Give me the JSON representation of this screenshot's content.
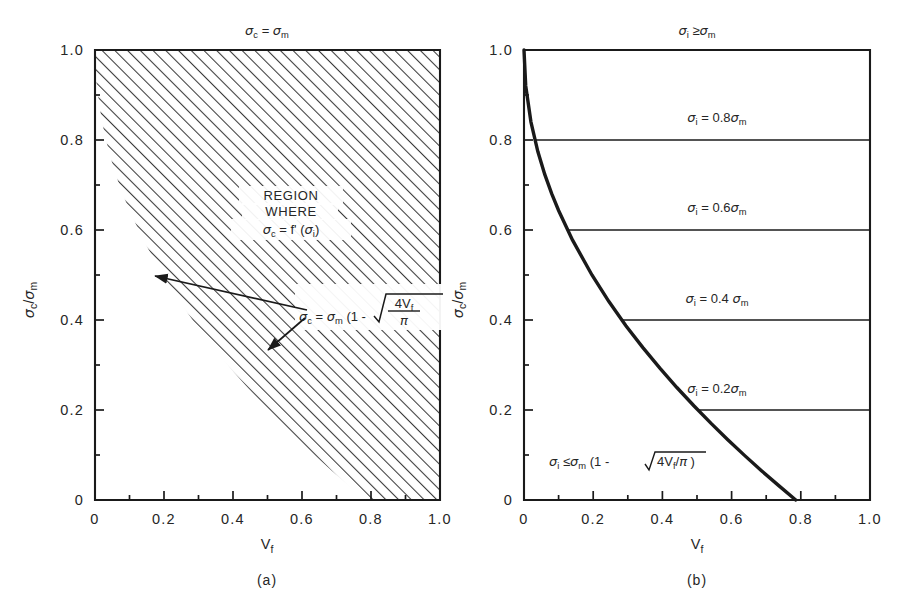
{
  "figure": {
    "background": "#ffffff",
    "ink": "#1a1a1a"
  },
  "panels": [
    {
      "id": "a",
      "label": "(a)",
      "top_label": "σc = σm",
      "xlabel": "Vf",
      "ylabel": "σc/σm",
      "annotations": {
        "region_line1": "REGION",
        "region_line2": "WHERE",
        "region_line3": "σc = f' (σi)",
        "equation": "σc = σm (1 - √(4Vf/π))"
      }
    },
    {
      "id": "b",
      "label": "(b)",
      "top_label": "σi ≥ σm",
      "xlabel": "Vf",
      "ylabel": "σc/σm",
      "annotations": {
        "line_08": "σi = 0.8σm",
        "line_06": "σi = 0.6σm",
        "line_04": "σi = 0.4σm",
        "line_02": "σi = 0.2σm",
        "lower_bound": "σi ≤ σm (1 - √4Vf/π )"
      }
    }
  ],
  "chart_data": {
    "type": "line",
    "title": "",
    "xlabel": "Vf",
    "ylabel": "σc/σm",
    "xlim": [
      0,
      1.0
    ],
    "ylim": [
      0,
      1.0
    ],
    "grid": false,
    "legend_position": "none",
    "x_ticks": [
      "0",
      "0.2",
      "0.4",
      "0.6",
      "0.8",
      "1.0"
    ],
    "x_tick_values": [
      0,
      0.2,
      0.4,
      0.6,
      0.8,
      1.0
    ],
    "y_ticks": [
      "0",
      "0.2",
      "0.4",
      "0.6",
      "0.8",
      "1.0"
    ],
    "y_tick_values": [
      0,
      0.2,
      0.4,
      0.6,
      0.8,
      1.0
    ],
    "minor_tick_step": 0.1,
    "series": [
      {
        "name": "sigma_c/sigma_m = 1 - sqrt(4Vf/pi)",
        "panel": "a",
        "role": "region-boundary",
        "x": [
          0.0,
          0.005,
          0.02,
          0.04,
          0.06,
          0.08,
          0.1,
          0.14,
          0.1964,
          0.2454,
          0.2945,
          0.3436,
          0.3927,
          0.4418,
          0.4909,
          0.54,
          0.589,
          0.6381,
          0.6872,
          0.7363,
          0.7854
        ],
        "y": [
          1.0,
          0.9202,
          0.8404,
          0.7743,
          0.7236,
          0.6808,
          0.6433,
          0.5779,
          0.5,
          0.4409,
          0.3874,
          0.3386,
          0.2929,
          0.25,
          0.2094,
          0.1708,
          0.134,
          0.0986,
          0.0646,
          0.0319,
          0.0
        ]
      },
      {
        "name": "sigma_c/sigma_m = 1 - sqrt(4Vf/pi)",
        "panel": "b",
        "role": "curve",
        "x": [
          0.0,
          0.005,
          0.02,
          0.04,
          0.06,
          0.08,
          0.1,
          0.14,
          0.1964,
          0.2454,
          0.2945,
          0.3436,
          0.3927,
          0.4418,
          0.4909,
          0.54,
          0.589,
          0.6381,
          0.6872,
          0.7363,
          0.7854
        ],
        "y": [
          1.0,
          0.9202,
          0.8404,
          0.7743,
          0.7236,
          0.6808,
          0.6433,
          0.5779,
          0.5,
          0.4409,
          0.3874,
          0.3386,
          0.2929,
          0.25,
          0.2094,
          0.1708,
          0.134,
          0.0986,
          0.0646,
          0.0319,
          0.0
        ]
      }
    ],
    "horizontal_lines_panel_b": [
      {
        "y": 0.8,
        "x_start": 0.0314,
        "x_end": 1.0,
        "label": "σi = 0.8σm"
      },
      {
        "y": 0.6,
        "x_start": 0.1257,
        "x_end": 1.0,
        "label": "σi = 0.6σm"
      },
      {
        "y": 0.4,
        "x_start": 0.2827,
        "x_end": 1.0,
        "label": "σi = 0.4σm"
      },
      {
        "y": 0.2,
        "x_start": 0.5027,
        "x_end": 1.0,
        "label": "σi = 0.2σm"
      }
    ],
    "shaded_region_panel_a": {
      "description": "diagonal hatching above/right of boundary curve",
      "hatch_angle_deg": 45,
      "fill": "hatch"
    },
    "arrows_panel_a": [
      {
        "from_x": 0.545,
        "from_y": 0.395,
        "to_x": 0.172,
        "to_y": 0.502
      },
      {
        "from_x": 0.545,
        "from_y": 0.375,
        "to_x": 0.455,
        "to_y": 0.222
      }
    ]
  }
}
